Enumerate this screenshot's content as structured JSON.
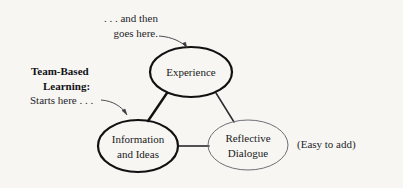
{
  "figure": {
    "background_color": "#f7f6f3",
    "ink_color": "#1a1a1a",
    "light_ink_color": "#5a5a60"
  },
  "nodes": {
    "experience": {
      "label": "Experience",
      "cx": 191,
      "cy": 72,
      "rx": 41,
      "ry": 25,
      "stroke_width": 2.2,
      "stroke": "#111111"
    },
    "information": {
      "label_line1": "Information",
      "label_line2": "and Ideas",
      "cx": 138,
      "cy": 146,
      "rx": 40,
      "ry": 26,
      "stroke_width": 2.2,
      "stroke": "#111111"
    },
    "reflective": {
      "label_line1": "Reflective",
      "label_line2": "Dialogue",
      "cx": 248,
      "cy": 145,
      "rx": 40,
      "ry": 25,
      "stroke_width": 1.0,
      "stroke": "#6f6f76"
    }
  },
  "connectors": {
    "experience_to_information": {
      "stroke_width": 2.4,
      "stroke": "#111111"
    },
    "experience_to_reflective": {
      "stroke_width": 1.5,
      "stroke": "#2a2a2e"
    },
    "information_to_reflective": {
      "stroke_width": 1.6,
      "stroke": "#1c1c20"
    }
  },
  "annotations": {
    "top_note": {
      "line1": ". . . and then",
      "line2": "goes here."
    },
    "left_note": {
      "line1": "Team-Based",
      "line2": "Learning:",
      "line3": "Starts here . . ."
    },
    "right_note": {
      "text": "(Easy to add)"
    }
  }
}
